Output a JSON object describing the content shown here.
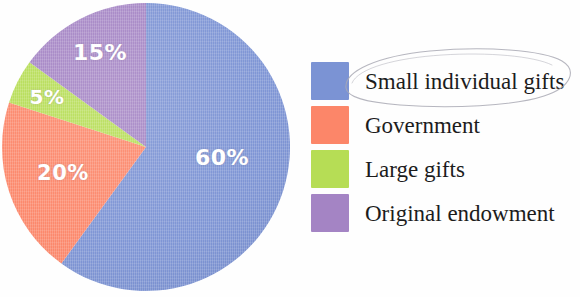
{
  "chart_data": {
    "type": "pie",
    "title": "",
    "subtitle": "",
    "xlabel": "",
    "ylabel": "",
    "legend_position": "right",
    "grid": false,
    "start_angle_deg": 0,
    "direction": "clockwise",
    "categories": [
      "Small individual gifts",
      "Government",
      "Large gifts",
      "Original endowment"
    ],
    "values": [
      60,
      20,
      5,
      15
    ],
    "value_unit": "%",
    "data_labels": [
      "60%",
      "20%",
      "5%",
      "15%"
    ],
    "colors": [
      "#7b93d4",
      "#fc8669",
      "#b6dd55",
      "#a484c4"
    ],
    "slices": [
      {
        "label": "Small individual gifts",
        "value": 60,
        "data_label": "60%",
        "color": "#7b93d4"
      },
      {
        "label": "Government",
        "value": 20,
        "data_label": "20%",
        "color": "#fc8669"
      },
      {
        "label": "Large gifts",
        "value": 5,
        "data_label": "5%",
        "color": "#b6dd55"
      },
      {
        "label": "Original endowment",
        "value": 15,
        "data_label": "15%",
        "color": "#a484c4"
      }
    ]
  },
  "legend": {
    "items": [
      {
        "label": "Small individual gifts",
        "color": "#7b93d4"
      },
      {
        "label": "Government",
        "color": "#fc8669"
      },
      {
        "label": "Large gifts",
        "color": "#b6dd55"
      },
      {
        "label": "Original endowment",
        "color": "#a484c4"
      }
    ]
  },
  "annotation": {
    "type": "hand-drawn-ellipse",
    "target": "Small individual gifts",
    "color": "#a9a9b4"
  },
  "figure": {
    "background": "#fefefe",
    "label_text_color": "#ffffff",
    "legend_text_color": "#1c1c1c"
  }
}
